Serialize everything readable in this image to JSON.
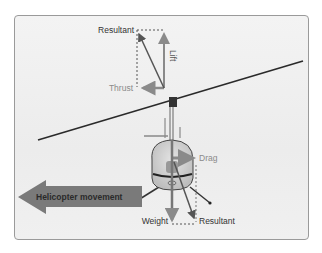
{
  "diagram": {
    "labels": {
      "top_resultant": "Resultant",
      "lift": "Lift",
      "thrust": "Thrust",
      "drag": "Drag",
      "weight": "Weight",
      "bottom_resultant": "Resultant",
      "movement": "Helicopter movement"
    },
    "colors": {
      "lift_thrust_arrow": "#8a8a8a",
      "resultant_arrow": "#555555",
      "movement_arrow": "#7a7a7a",
      "rotor_blade": "#2a2a2a",
      "fuselage": "#d9d9d9",
      "frame_border": "#9a9a9a",
      "background": "#efefef",
      "label_dark": "#333333",
      "label_light": "#8a8a8a"
    }
  }
}
